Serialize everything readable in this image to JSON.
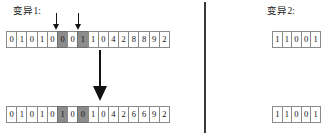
{
  "panels": [
    {
      "id": "mutation-1",
      "title": "变异1:",
      "parent": {
        "label": "parent-chromosome",
        "genes": [
          "0",
          "1",
          "0",
          "1",
          "0",
          "0",
          "0",
          "1",
          "1",
          "0",
          "4",
          "2",
          "8",
          "8",
          "9",
          "2"
        ],
        "highlighted": [
          5,
          7
        ]
      },
      "child": {
        "label": "child-chromosome",
        "genes": [
          "0",
          "1",
          "0",
          "1",
          "0",
          "1",
          "0",
          "0",
          "1",
          "0",
          "4",
          "2",
          "6",
          "6",
          "9",
          "2"
        ],
        "highlighted": [
          5,
          7
        ]
      },
      "markers": {
        "count": 2,
        "icons": [
          "down-arrow-icon",
          "down-arrow-icon"
        ],
        "targets": [
          5,
          7
        ]
      },
      "transition_icon": "large-down-arrow-icon"
    },
    {
      "id": "mutation-2",
      "title": "变异2:",
      "parent": {
        "label": "parent-chromosome",
        "genes": [
          "1",
          "1",
          "0",
          "0",
          "1"
        ],
        "highlighted": []
      },
      "child": {
        "label": "child-chromosome",
        "genes": [
          "1",
          "1",
          "0",
          "0",
          "1"
        ],
        "highlighted": []
      }
    }
  ],
  "colors": {
    "cell_border": "#8a8a8a",
    "cell_background": "#ffffff",
    "cell_highlight": "#8c8c8c",
    "arrow": "#121212",
    "divider": "#3a3a3a",
    "text": "#111111"
  }
}
